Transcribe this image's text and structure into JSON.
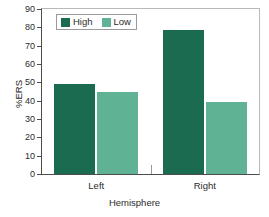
{
  "chart_data": {
    "type": "bar",
    "title": "",
    "subtitle": "",
    "xlabel": "Hemisphere",
    "ylabel": "%ERS",
    "categories": [
      "Left",
      "Right"
    ],
    "series": [
      {
        "name": "High",
        "values": [
          49,
          78.5
        ],
        "color": "#1a6b4f"
      },
      {
        "name": "Low",
        "values": [
          44.5,
          39.5
        ],
        "color": "#5fb394"
      }
    ],
    "ylim": [
      0,
      90
    ],
    "ytick_step": 10,
    "yticks": [
      0,
      10,
      20,
      30,
      40,
      50,
      60,
      70,
      80,
      90
    ],
    "ytick_labels": [
      "0",
      "10",
      "20",
      "30",
      "40",
      "50",
      "60",
      "70",
      "80",
      "90"
    ],
    "grid": false,
    "legend_position": "top-left-inside",
    "annotations": []
  },
  "legend": {
    "entries": [
      {
        "label": "High",
        "color": "#1a6b4f"
      },
      {
        "label": "Low",
        "color": "#5fb394"
      }
    ]
  },
  "colors": {
    "high": "#1a6b4f",
    "low": "#5fb394",
    "axis": "#4d4d4d",
    "frame": "#b9b9b9",
    "text": "#2b2b2b",
    "background": "#ffffff"
  }
}
